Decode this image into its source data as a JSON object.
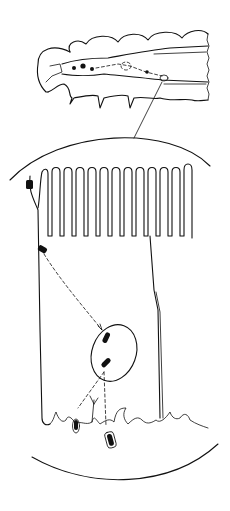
{
  "figure": {
    "labels": [],
    "colors": {
      "ink": "#111111",
      "background": "#ffffff"
    },
    "parts": {
      "larva": "larva-outline",
      "zoom_line": "magnification-pointer",
      "circle": "magnified-field",
      "microvilli_count": 13,
      "nucleus": "cell-nucleus",
      "particles": 5
    }
  }
}
